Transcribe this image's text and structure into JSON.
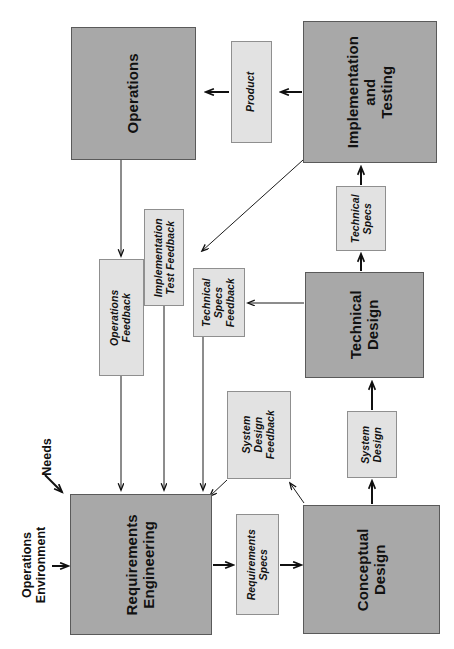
{
  "diagram": {
    "orientation": "rotated-90",
    "colors": {
      "process_fill": "#a8a8a8",
      "process_border": "#5a5a5a",
      "artifact_fill": "#e2e2e2",
      "artifact_border": "#8f8f8f",
      "line": "#1b1b1b",
      "text": "#111111"
    },
    "processes": [
      {
        "id": "operations",
        "label": "Operations"
      },
      {
        "id": "implementation_testing",
        "label": "Implementation\nand\nTesting"
      },
      {
        "id": "technical_design",
        "label": "Technical\nDesign"
      },
      {
        "id": "requirements_engineering",
        "label": "Requirements\nEngineering"
      },
      {
        "id": "conceptual_design",
        "label": "Conceptual\nDesign"
      }
    ],
    "artifacts": [
      {
        "id": "product",
        "label": "Product"
      },
      {
        "id": "technical_specs",
        "label": "Technical\nSpecs"
      },
      {
        "id": "operations_feedback",
        "label": "Operations\nFeedback"
      },
      {
        "id": "implementation_test_feedback",
        "label": "Implementation\nTest Feedback"
      },
      {
        "id": "technical_specs_feedback",
        "label": "Technical\nSpecs\nFeedback"
      },
      {
        "id": "system_design_feedback",
        "label": "System\nDesign\nFeedback"
      },
      {
        "id": "system_design",
        "label": "System\nDesign"
      },
      {
        "id": "requirements_specs",
        "label": "Requirements\nSpecs"
      }
    ],
    "external_inputs": [
      {
        "id": "needs",
        "label": "Needs"
      },
      {
        "id": "operations_environment",
        "label": "Operations\nEnvironment"
      }
    ],
    "process_labels": {
      "operations": "Operations",
      "implementation_testing_line1": "Implementation",
      "implementation_testing_line2": "and",
      "implementation_testing_line3": "Testing",
      "technical_design_line1": "Technical",
      "technical_design_line2": "Design",
      "requirements_engineering_line1": "Requirements",
      "requirements_engineering_line2": "Engineering",
      "conceptual_design_line1": "Conceptual",
      "conceptual_design_line2": "Design"
    },
    "artifact_labels": {
      "product": "Product",
      "technical_specs_line1": "Technical",
      "technical_specs_line2": "Specs",
      "operations_feedback_line1": "Operations",
      "operations_feedback_line2": "Feedback",
      "implementation_test_feedback_line1": "Implementation",
      "implementation_test_feedback_line2": "Test Feedback",
      "technical_specs_feedback_line1": "Technical",
      "technical_specs_feedback_line2": "Specs",
      "technical_specs_feedback_line3": "Feedback",
      "system_design_feedback_line1": "System",
      "system_design_feedback_line2": "Design",
      "system_design_feedback_line3": "Feedback",
      "system_design_line1": "System",
      "system_design_line2": "Design",
      "requirements_specs_line1": "Requirements",
      "requirements_specs_line2": "Specs"
    },
    "input_labels": {
      "needs": "Needs",
      "operations_environment_line1": "Operations",
      "operations_environment_line2": "Environment"
    },
    "flows": [
      {
        "from": "requirements_engineering",
        "to": "requirements_specs"
      },
      {
        "from": "requirements_specs",
        "to": "conceptual_design"
      },
      {
        "from": "conceptual_design",
        "to": "system_design"
      },
      {
        "from": "system_design",
        "to": "technical_design"
      },
      {
        "from": "technical_design",
        "to": "technical_specs"
      },
      {
        "from": "technical_specs",
        "to": "implementation_testing"
      },
      {
        "from": "implementation_testing",
        "to": "product"
      },
      {
        "from": "product",
        "to": "operations"
      },
      {
        "from": "operations",
        "to": "operations_feedback"
      },
      {
        "from": "operations_feedback",
        "to": "requirements_engineering"
      },
      {
        "from": "implementation_testing",
        "to": "implementation_test_feedback"
      },
      {
        "from": "implementation_test_feedback",
        "to": "requirements_engineering"
      },
      {
        "from": "technical_design",
        "to": "technical_specs_feedback"
      },
      {
        "from": "technical_specs_feedback",
        "to": "requirements_engineering"
      },
      {
        "from": "conceptual_design",
        "to": "system_design_feedback"
      },
      {
        "from": "system_design_feedback",
        "to": "requirements_engineering"
      },
      {
        "from": "needs",
        "to": "requirements_engineering"
      },
      {
        "from": "operations_environment",
        "to": "requirements_engineering"
      }
    ]
  }
}
